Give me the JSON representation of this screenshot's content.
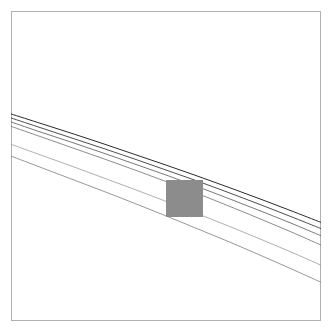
{
  "figure": {
    "title": "",
    "subtitle": "",
    "background_color": "#ffffff",
    "width": 332,
    "height": 333
  },
  "axes": {
    "frame_color": "#b0b0b0",
    "frame_x": 11,
    "frame_y": 11,
    "frame_width": 310,
    "frame_height": 310,
    "ticks_visible": "false",
    "tick_labels_visible": "false",
    "grid": "off",
    "xlabel": "",
    "ylabel": "",
    "x_tick_labels": [],
    "y_tick_labels": []
  },
  "roi": {
    "label": "inset-region",
    "color": "#8c8c8c",
    "x": 166,
    "y": 180,
    "width": 37,
    "height": 37,
    "opacity": 1
  },
  "chart_data": {
    "type": "line",
    "title": "",
    "subtitle": "",
    "xlabel": "",
    "ylabel": "",
    "xlim": [
      0,
      1
    ],
    "ylim": [
      0,
      1
    ],
    "grid": "off",
    "legend": "none",
    "legend_position": "none",
    "axis_ticks": "none",
    "annotations": [
      {
        "kind": "shaded-rectangle",
        "label": "inset-region",
        "x": 0.5,
        "y": 0.455,
        "width": 0.119,
        "height": 0.119,
        "color": "#8c8c8c"
      }
    ],
    "x": [
      0.0,
      0.1,
      0.2,
      0.3,
      0.4,
      0.5,
      0.6,
      0.7,
      0.8,
      0.9,
      1.0
    ],
    "series": [
      {
        "name": "curve-1",
        "color": "#2b2b2b",
        "linewidth": 1.0,
        "linestyle": "solid",
        "values": [
          0.668,
          0.636,
          0.604,
          0.571,
          0.537,
          0.503,
          0.468,
          0.432,
          0.395,
          0.357,
          0.318
        ]
      },
      {
        "name": "curve-2",
        "color": "#3a3a3a",
        "linewidth": 0.9,
        "linestyle": "solid",
        "values": [
          0.655,
          0.622,
          0.589,
          0.556,
          0.522,
          0.487,
          0.452,
          0.415,
          0.377,
          0.338,
          0.298
        ]
      },
      {
        "name": "curve-3",
        "color": "#555555",
        "linewidth": 0.8,
        "linestyle": "solid",
        "values": [
          0.642,
          0.608,
          0.575,
          0.541,
          0.506,
          0.471,
          0.434,
          0.396,
          0.357,
          0.317,
          0.275
        ]
      },
      {
        "name": "curve-4",
        "color": "#6e6e6e",
        "linewidth": 0.8,
        "linestyle": "solid",
        "values": [
          0.628,
          0.593,
          0.558,
          0.523,
          0.487,
          0.45,
          0.412,
          0.372,
          0.331,
          0.289,
          0.245
        ]
      },
      {
        "name": "curve-5",
        "color": "#9a9a9a",
        "linewidth": 0.8,
        "linestyle": "solid",
        "values": [
          0.57,
          0.534,
          0.498,
          0.461,
          0.424,
          0.386,
          0.347,
          0.307,
          0.266,
          0.224,
          0.18
        ]
      },
      {
        "name": "curve-6",
        "color": "#7d7d7d",
        "linewidth": 0.8,
        "linestyle": "solid",
        "values": [
          0.532,
          0.494,
          0.456,
          0.418,
          0.379,
          0.339,
          0.298,
          0.257,
          0.214,
          0.17,
          0.125
        ]
      }
    ]
  }
}
